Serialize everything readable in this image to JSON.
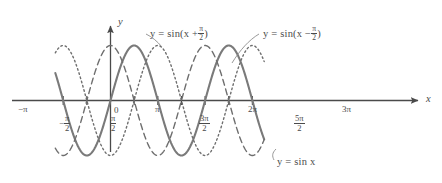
{
  "figure": {
    "background": "#ffffff",
    "ink": "#4a4a4a",
    "curve_color": "#7a7a7a",
    "axis_color": "#4a4a4a"
  },
  "axes": {
    "x_axis_label": "x",
    "y_axis_label": "y",
    "origin_label": "0",
    "x_ticks": [
      {
        "label": "−π",
        "value": -3.14159,
        "kind": "plain"
      },
      {
        "label": "−π/2",
        "value": -1.5708,
        "kind": "fraction",
        "sign": "−",
        "num": "π",
        "den": "2"
      },
      {
        "label": "0",
        "value": 0,
        "kind": "origin"
      },
      {
        "label": "π/2",
        "value": 1.5708,
        "kind": "fraction",
        "sign": "",
        "num": "π",
        "den": "2"
      },
      {
        "label": "π",
        "value": 3.14159,
        "kind": "plain"
      },
      {
        "label": "3π/2",
        "value": 4.71239,
        "kind": "fraction",
        "sign": "",
        "num": "3π",
        "den": "2"
      },
      {
        "label": "2π",
        "value": 6.28319,
        "kind": "plain"
      },
      {
        "label": "5π/2",
        "value": 7.85398,
        "kind": "fraction",
        "sign": "",
        "num": "5π",
        "den": "2"
      },
      {
        "label": "3π",
        "value": 9.42478,
        "kind": "plain"
      }
    ]
  },
  "annotations": {
    "cos_label": "y = sin(x + π/2)",
    "cos_label_parts": {
      "lhs": "y = sin(x +",
      "num": "π",
      "den": "2",
      "rhs": ")"
    },
    "negcos_label": "y = sin(x − π/2)",
    "negcos_label_parts": {
      "lhs": "y = sin(x −",
      "num": "π",
      "den": "2",
      "rhs": ")"
    },
    "sin_label": "y = sin x"
  },
  "chart_data": {
    "type": "line",
    "title": "",
    "xlabel": "x",
    "ylabel": "y",
    "xlim": [
      -3.665,
      10.21
    ],
    "ylim": [
      -1.18,
      1.18
    ],
    "grid": false,
    "legend": "inline-annotations",
    "x_tick_values": [
      -3.14159,
      -1.5708,
      0,
      1.5708,
      3.14159,
      4.71239,
      6.28319,
      7.85398,
      9.42478
    ],
    "x_tick_labels": [
      "−π",
      "−π/2",
      "0",
      "π/2",
      "π",
      "3π/2",
      "2π",
      "5π/2",
      "3π"
    ],
    "series": [
      {
        "name": "y = sin x",
        "expression": "sin(x)",
        "phase": 0,
        "amplitude": 1,
        "period": 6.28319,
        "style": "solid",
        "color": "#7a7a7a",
        "width": 2.1,
        "zeros": [
          -3.14159,
          0,
          3.14159,
          6.28319,
          9.42478
        ],
        "maxima_x": [
          1.5708,
          7.85398
        ],
        "minima_x": [
          -1.5708,
          4.71239
        ]
      },
      {
        "name": "y = sin(x + π/2)",
        "expression": "sin(x + pi/2)",
        "phase": 1.5708,
        "amplitude": 1,
        "period": 6.28319,
        "style": "dashed",
        "color": "#6e6e6e",
        "width": 1.4,
        "zeros": [
          -1.5708,
          1.5708,
          4.71239,
          7.85398
        ],
        "maxima_x": [
          0,
          6.28319
        ],
        "minima_x": [
          -3.14159,
          3.14159,
          9.42478
        ]
      },
      {
        "name": "y = sin(x − π/2)",
        "expression": "sin(x - pi/2)",
        "phase": -1.5708,
        "amplitude": 1,
        "period": 6.28319,
        "style": "dotted",
        "color": "#6e6e6e",
        "width": 1.4,
        "zeros": [
          -1.5708,
          1.5708,
          4.71239,
          7.85398
        ],
        "maxima_x": [
          -3.14159,
          3.14159,
          9.42478
        ],
        "minima_x": [
          0,
          6.28319
        ]
      }
    ]
  }
}
